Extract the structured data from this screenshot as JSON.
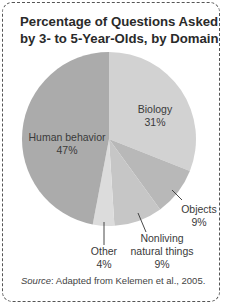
{
  "chart_data": {
    "type": "pie",
    "title": "Percentage of Questions Asked by 3- to 5-Year-Olds, by Domain",
    "slices": [
      {
        "label": "Biology",
        "value": 31,
        "display": "31%",
        "color": "#d2d2d2"
      },
      {
        "label": "Objects",
        "value": 9,
        "display": "9%",
        "color": "#b8b8b8"
      },
      {
        "label": "Nonliving natural things",
        "value": 9,
        "display": "9%",
        "color": "#c6c6c6"
      },
      {
        "label": "Other",
        "value": 4,
        "display": "4%",
        "color": "#dcdcdc"
      },
      {
        "label": "Human behavior",
        "value": 47,
        "display": "47%",
        "color": "#ababab"
      }
    ],
    "start_angle": "top, clockwise",
    "source_label": "Source",
    "source_text": ": Adapted from Kelemen et al., 2005."
  },
  "title_line1": "Percentage of Questions Asked",
  "title_line2": "by 3- to 5-Year-Olds, by Domain",
  "labels": {
    "biology_name": "Biology",
    "biology_pct": "31%",
    "human_name": "Human behavior",
    "human_pct": "47%",
    "objects_name": "Objects",
    "objects_pct": "9%",
    "nonliving_name1": "Nonliving",
    "nonliving_name2": "natural things",
    "nonliving_pct": "9%",
    "other_name": "Other",
    "other_pct": "4%"
  }
}
